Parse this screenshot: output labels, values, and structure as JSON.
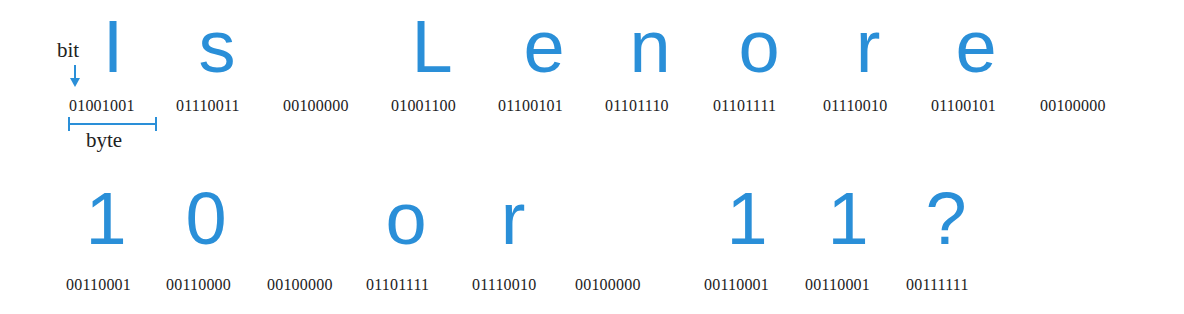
{
  "annotations": {
    "bit_label": "bit",
    "byte_label": "byte",
    "accent_color": "#2a8fd8"
  },
  "rows": [
    {
      "text": "Is Lenore ",
      "chars": [
        {
          "glyph": "I",
          "binary": "01001001"
        },
        {
          "glyph": "s",
          "binary": "01110011"
        },
        {
          "glyph": " ",
          "binary": "00100000"
        },
        {
          "glyph": "L",
          "binary": "01001100"
        },
        {
          "glyph": "e",
          "binary": "01100101"
        },
        {
          "glyph": "n",
          "binary": "01101110"
        },
        {
          "glyph": "o",
          "binary": "01101111"
        },
        {
          "glyph": "r",
          "binary": "01110010"
        },
        {
          "glyph": "e",
          "binary": "01100101"
        },
        {
          "glyph": " ",
          "binary": "00100000"
        }
      ]
    },
    {
      "text": "10 or 11?",
      "chars": [
        {
          "glyph": "1",
          "binary": "00110001"
        },
        {
          "glyph": "0",
          "binary": "00110000"
        },
        {
          "glyph": " ",
          "binary": "00100000"
        },
        {
          "glyph": "o",
          "binary": "01101111"
        },
        {
          "glyph": "r",
          "binary": "01110010"
        },
        {
          "glyph": " ",
          "binary": "00100000"
        },
        {
          "glyph": "1",
          "binary": "00110001"
        },
        {
          "glyph": "1",
          "binary": "00110001"
        },
        {
          "glyph": "?",
          "binary": "00111111"
        }
      ]
    }
  ]
}
